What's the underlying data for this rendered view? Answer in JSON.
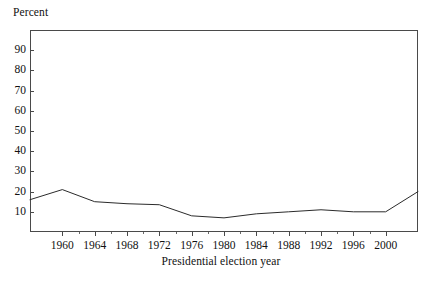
{
  "chart_data": {
    "type": "line",
    "title": "",
    "xlabel": "Presidential election year",
    "ylabel": "Percent",
    "ylim": [
      0,
      100
    ],
    "xlim": [
      1956,
      2004
    ],
    "grid": false,
    "legend": null,
    "yticks": [
      90,
      80,
      70,
      60,
      50,
      40,
      30,
      20,
      10
    ],
    "ytick_labels": [
      "90",
      "80",
      "70",
      "60",
      "50",
      "40",
      "30",
      "20",
      "10"
    ],
    "xticks": [
      1960,
      1964,
      1968,
      1972,
      1976,
      1980,
      1984,
      1988,
      1992,
      1996,
      2000
    ],
    "xtick_labels": [
      "1960",
      "1964",
      "1968",
      "1972",
      "1976",
      "1980",
      "1984",
      "1988",
      "1992",
      "1996",
      "2000"
    ],
    "x": [
      1956,
      1960,
      1964,
      1968,
      1972,
      1976,
      1980,
      1984,
      1988,
      1992,
      1996,
      2000,
      2004
    ],
    "values": [
      16,
      21,
      15,
      14,
      13.5,
      8,
      7,
      9,
      10,
      11,
      10,
      10,
      20
    ],
    "series": [
      {
        "name": "Percent",
        "x": [
          1956,
          1960,
          1964,
          1968,
          1972,
          1976,
          1980,
          1984,
          1988,
          1992,
          1996,
          2000,
          2004
        ],
        "values": [
          16,
          21,
          15,
          14,
          13.5,
          8,
          7,
          9,
          10,
          11,
          10,
          10,
          20
        ],
        "color": "#2b2b2b"
      }
    ]
  },
  "axes": {
    "y_title": "Percent",
    "x_title": "Presidential election year"
  },
  "colors": {
    "line": "#2b2b2b",
    "frame": "#4a4a4a",
    "background": "#ffffff",
    "text": "#111111"
  }
}
